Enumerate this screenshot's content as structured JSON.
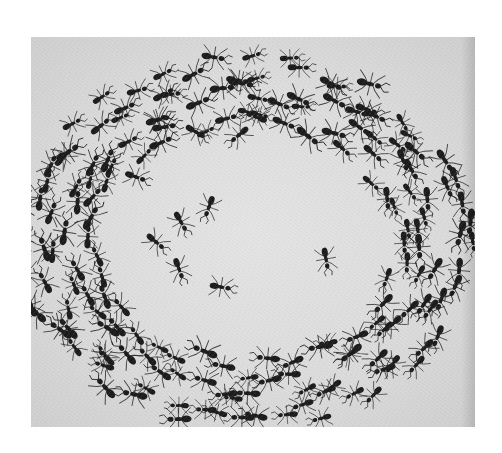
{
  "image": {
    "subject": "army ants circling in a mill",
    "style": "black-and-white photograph",
    "frame": {
      "left": 31,
      "top": 37,
      "width": 444,
      "height": 390
    },
    "colors": {
      "background": "#ffffff",
      "surface": "#dcdcdc",
      "ant": "#1c1c1c"
    }
  },
  "mill": {
    "center": [
      215,
      205
    ],
    "rings": [
      {
        "rx": 215,
        "ry": 175,
        "count": 70,
        "jitter": 14
      },
      {
        "rx": 185,
        "ry": 150,
        "count": 60,
        "jitter": 14
      },
      {
        "rx": 155,
        "ry": 125,
        "count": 42,
        "jitter": 12
      }
    ],
    "inner_ants": [
      [
        105,
        140,
        20
      ],
      [
        150,
        185,
        60
      ],
      [
        190,
        250,
        10
      ],
      [
        295,
        222,
        80
      ],
      [
        125,
        205,
        40
      ],
      [
        165,
        95,
        30
      ],
      [
        208,
        98,
        140
      ],
      [
        178,
        170,
        110
      ],
      [
        225,
        80,
        200
      ],
      [
        148,
        232,
        70
      ]
    ]
  }
}
